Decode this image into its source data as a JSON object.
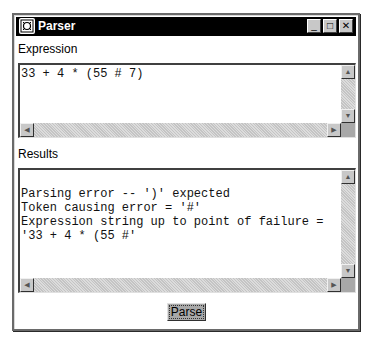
{
  "window": {
    "title": "Parser",
    "controls": {
      "minimize": "_",
      "maximize": "□",
      "close": "✕"
    }
  },
  "expression": {
    "label": "Expression",
    "value": "33 + 4 * (55 # 7)"
  },
  "results": {
    "label": "Results",
    "lines": [
      "",
      "Parsing error -- ')' expected",
      "Token causing error = '#'",
      "Expression string up to point of failure =",
      "'33 + 4 * (55 #'"
    ]
  },
  "scroll_glyphs": {
    "up": "▲",
    "down": "▼",
    "left": "◀",
    "right": "▶"
  },
  "parse_button": {
    "label": "Parse"
  }
}
